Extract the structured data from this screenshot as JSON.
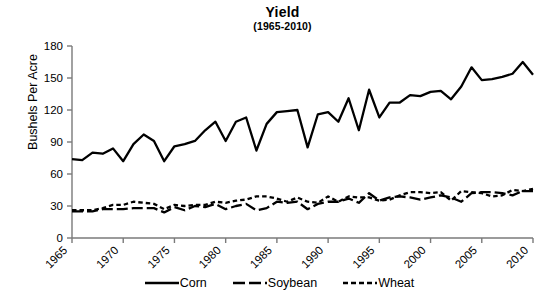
{
  "chart_data": {
    "type": "line",
    "title": "Yield",
    "subtitle": "(1965-2010)",
    "xlabel": "",
    "ylabel": "Bushels Per Acre",
    "ylim": [
      0,
      180
    ],
    "xlim": [
      1965,
      2010
    ],
    "yticks": [
      0,
      30,
      60,
      90,
      120,
      150,
      180
    ],
    "xticks": [
      1965,
      1970,
      1975,
      1980,
      1985,
      1990,
      1995,
      2000,
      2005,
      2010
    ],
    "grid": false,
    "legend_position": "bottom",
    "x": [
      1965,
      1966,
      1967,
      1968,
      1969,
      1970,
      1971,
      1972,
      1973,
      1974,
      1975,
      1976,
      1977,
      1978,
      1979,
      1980,
      1981,
      1982,
      1983,
      1984,
      1985,
      1986,
      1987,
      1988,
      1989,
      1990,
      1991,
      1992,
      1993,
      1994,
      1995,
      1996,
      1997,
      1998,
      1999,
      2000,
      2001,
      2002,
      2003,
      2004,
      2005,
      2006,
      2007,
      2008,
      2009,
      2010
    ],
    "series": [
      {
        "name": "Corn",
        "style": "solid",
        "values": [
          74,
          73,
          80,
          79,
          84,
          72,
          88,
          97,
          91,
          72,
          86,
          88,
          91,
          101,
          109,
          91,
          109,
          113,
          82,
          107,
          118,
          119,
          120,
          85,
          116,
          118,
          109,
          131,
          101,
          139,
          113,
          127,
          127,
          134,
          133,
          137,
          138,
          130,
          142,
          160,
          148,
          149,
          151,
          154,
          165,
          153
        ]
      },
      {
        "name": "Soybean",
        "style": "long-dash",
        "values": [
          25,
          25,
          25,
          27,
          27,
          27,
          28,
          28,
          28,
          24,
          29,
          26,
          30,
          29,
          32,
          27,
          30,
          32,
          26,
          28,
          34,
          33,
          34,
          27,
          32,
          34,
          34,
          37,
          33,
          42,
          35,
          38,
          39,
          38,
          36,
          38,
          40,
          38,
          34,
          42,
          43,
          43,
          42,
          40,
          44,
          44
        ]
      },
      {
        "name": "Wheat",
        "style": "short-dash",
        "values": [
          26,
          26,
          26,
          28,
          31,
          31,
          34,
          33,
          32,
          27,
          31,
          30,
          31,
          31,
          34,
          33,
          35,
          36,
          39,
          39,
          37,
          34,
          38,
          34,
          33,
          39,
          34,
          39,
          38,
          38,
          35,
          36,
          40,
          43,
          43,
          42,
          43,
          35,
          44,
          43,
          42,
          39,
          40,
          45,
          44,
          46
        ]
      }
    ]
  },
  "axis": {
    "ytick_labels": [
      "180",
      "150",
      "120",
      "90",
      "60",
      "30",
      "0"
    ],
    "xtick_labels": [
      "1965",
      "1970",
      "1975",
      "1980",
      "1985",
      "1990",
      "1995",
      "2000",
      "2005",
      "2010"
    ]
  },
  "legend": {
    "items": [
      {
        "label": "Corn",
        "style": "solid"
      },
      {
        "label": "Soybean",
        "style": "long-dash"
      },
      {
        "label": "Wheat",
        "style": "short-dash"
      }
    ]
  }
}
